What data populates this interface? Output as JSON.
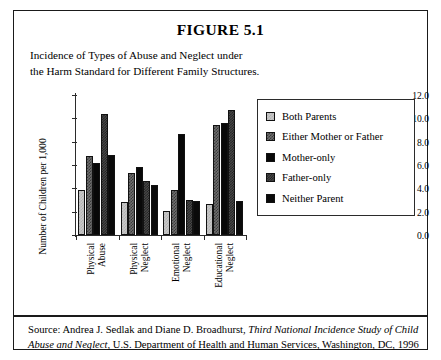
{
  "figure": {
    "title": "FIGURE 5.1",
    "caption_line1": "Incidence of Types of Abuse and Neglect under",
    "caption_line2": "the Harm Standard for Different Family Structures."
  },
  "source": {
    "prefix": "Source: Andrea J. Sedlak and Diane D. Broadhurst, ",
    "italic_part1": "Third National Incidence Study of Child",
    "italic_part2": "Abuse and Neglect",
    "suffix": ", U.S. Department of Health and Human Services, Washington, DC, 1996"
  },
  "chart_data": {
    "type": "bar",
    "title": "Incidence of Types of Abuse and Neglect under the Harm Standard for Different Family Structures.",
    "xlabel": "",
    "ylabel": "Number of Children per 1,000",
    "ylim": [
      0,
      12
    ],
    "ytick_labels": [
      "0.0",
      "2.0",
      "4.0",
      "6.0",
      "8.0",
      "10.0",
      "12.0"
    ],
    "ytick_values": [
      0,
      2,
      4,
      6,
      8,
      10,
      12
    ],
    "grid": false,
    "legend_position": "right",
    "categories": [
      "Physical Abuse",
      "Physical Neglect",
      "Emotional Neglect",
      "Educational Neglect"
    ],
    "category_lines": [
      [
        "Physical",
        "Abuse"
      ],
      [
        "Physical",
        "Neglect"
      ],
      [
        "Emotional",
        "Neglect"
      ],
      [
        "Educational",
        "Neglect"
      ]
    ],
    "series": [
      {
        "name": "Both Parents",
        "values": [
          3.9,
          2.8,
          2.1,
          2.7
        ],
        "pattern": "light-gray-checker"
      },
      {
        "name": "Either Mother or Father",
        "values": [
          6.8,
          5.3,
          3.9,
          9.4
        ],
        "pattern": "medium-gray-checker"
      },
      {
        "name": "Mother-only",
        "values": [
          6.2,
          5.8,
          8.7,
          9.6
        ],
        "pattern": "solid-black"
      },
      {
        "name": "Father-only",
        "values": [
          10.4,
          4.6,
          3.0,
          10.7
        ],
        "pattern": "dark-gray-checker"
      },
      {
        "name": "Neither Parent",
        "values": [
          6.9,
          4.3,
          2.9,
          2.9
        ],
        "pattern": "solid-black"
      }
    ]
  }
}
